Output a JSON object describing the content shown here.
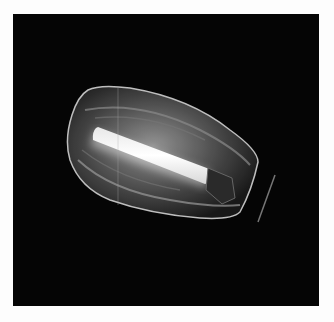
{
  "image": {
    "subject": "street lamp luminaire with glowing tube behind clear ribbed cover",
    "background_color": "#050505",
    "border_color": "#fdfdfd"
  }
}
